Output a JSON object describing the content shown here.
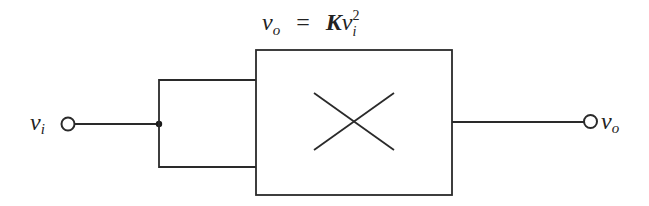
{
  "diagram": {
    "type": "block-diagram",
    "equation": {
      "lhs_var": "v",
      "lhs_sub": "o",
      "equals": "=",
      "coeff": "K",
      "rhs_var": "v",
      "rhs_sub": "i",
      "rhs_sup": "2"
    },
    "input": {
      "var": "v",
      "sub": "i"
    },
    "output": {
      "var": "v",
      "sub": "o"
    },
    "block": {
      "symbol": "multiplier-cross",
      "description": "Multiplier block with both inputs tied to v_i"
    },
    "colors": {
      "stroke": "#2a2a2a",
      "background": "#ffffff"
    }
  }
}
